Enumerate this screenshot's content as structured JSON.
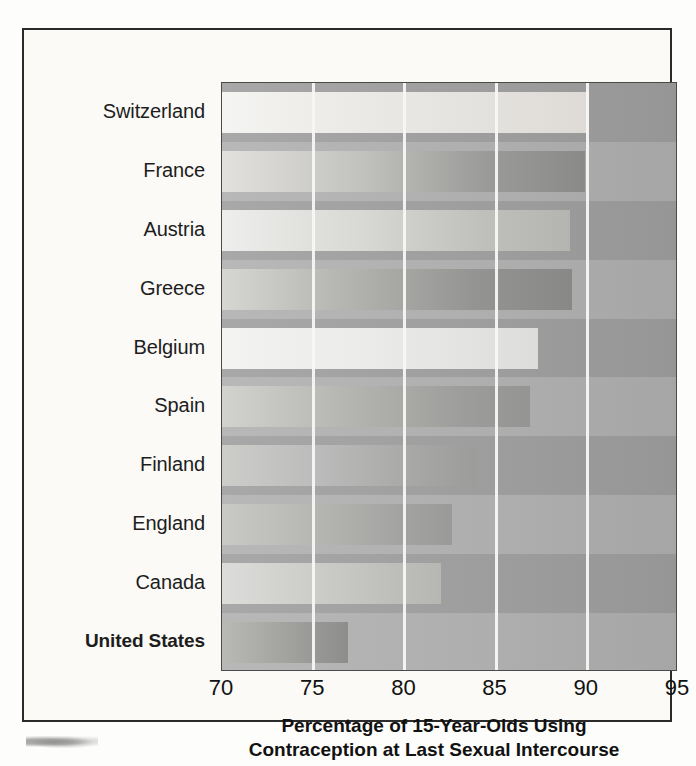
{
  "chart_data": {
    "type": "bar",
    "orientation": "horizontal",
    "title": "",
    "xlabel_line1": "Percentage of 15-Year-Olds Using",
    "xlabel_line2": "Contraception at Last Sexual Intercourse",
    "ylabel": "",
    "xlim": [
      70,
      95
    ],
    "xticks": [
      70,
      75,
      80,
      85,
      90,
      95
    ],
    "xtick_labels": [
      "70",
      "75",
      "80",
      "85",
      "90",
      "95"
    ],
    "gridlines": [
      75,
      80,
      85,
      90
    ],
    "grid": true,
    "legend": "none",
    "categories": [
      "Switzerland",
      "France",
      "Austria",
      "Greece",
      "Belgium",
      "Spain",
      "Finland",
      "England",
      "Canada",
      "United States"
    ],
    "values": [
      90.1,
      89.9,
      89.1,
      89.2,
      87.3,
      86.9,
      83.9,
      82.6,
      82.0,
      76.9
    ],
    "highlighted_category": "United States",
    "bars": [
      {
        "label": "Switzerland",
        "value": 90.1,
        "tone": "tone-a",
        "emphasis": false
      },
      {
        "label": "France",
        "value": 89.9,
        "tone": "tone-b",
        "emphasis": false
      },
      {
        "label": "Austria",
        "value": 89.1,
        "tone": "tone-c",
        "emphasis": false
      },
      {
        "label": "Greece",
        "value": 89.2,
        "tone": "tone-d",
        "emphasis": false
      },
      {
        "label": "Belgium",
        "value": 87.3,
        "tone": "tone-e",
        "emphasis": false
      },
      {
        "label": "Spain",
        "value": 86.9,
        "tone": "tone-f",
        "emphasis": false
      },
      {
        "label": "Finland",
        "value": 83.9,
        "tone": "tone-g",
        "emphasis": false
      },
      {
        "label": "England",
        "value": 82.6,
        "tone": "tone-h",
        "emphasis": false
      },
      {
        "label": "Canada",
        "value": 82.0,
        "tone": "tone-i",
        "emphasis": false
      },
      {
        "label": "United States",
        "value": 76.9,
        "tone": "tone-j",
        "emphasis": true
      }
    ]
  },
  "colors": {
    "frame_border": "#2b2b2b",
    "plot_background": "#a9a9a9",
    "gridline": "#f7f7f5",
    "text": "#111111",
    "page_background": "#fbfaf7"
  }
}
